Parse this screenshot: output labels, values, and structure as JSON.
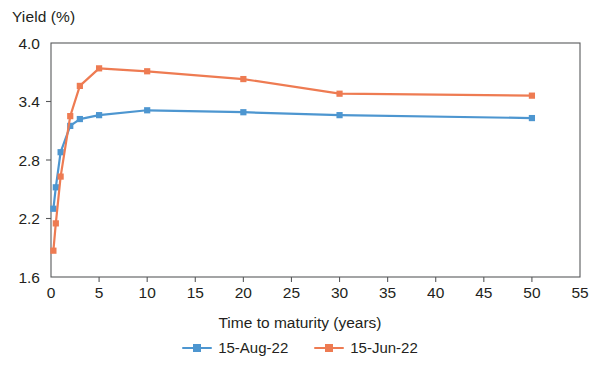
{
  "chart_data": {
    "type": "line",
    "title": "",
    "xlabel": "Time to maturity (years)",
    "ylabel": "Yield (%)",
    "xlim": [
      0,
      55
    ],
    "ylim": [
      1.6,
      4.0
    ],
    "xticks": [
      "0",
      "5",
      "10",
      "15",
      "20",
      "25",
      "30",
      "35",
      "40",
      "45",
      "50",
      "55"
    ],
    "yticks": [
      "1.6",
      "2.2",
      "2.8",
      "3.4",
      "4.0"
    ],
    "xtick_values": [
      0,
      5,
      10,
      15,
      20,
      25,
      30,
      35,
      40,
      45,
      50,
      55
    ],
    "ytick_values": [
      1.6,
      2.2,
      2.8,
      3.4,
      4.0
    ],
    "grid": false,
    "legend_position": "bottom",
    "x": [
      0.25,
      0.5,
      1,
      2,
      3,
      5,
      10,
      20,
      30,
      50
    ],
    "series": [
      {
        "name": "15-Aug-22",
        "color": "#4d96d0",
        "marker": "square",
        "values": [
          2.3,
          2.52,
          2.88,
          3.15,
          3.22,
          3.26,
          3.31,
          3.29,
          3.26,
          3.23
        ]
      },
      {
        "name": "15-Jun-22",
        "color": "#ee7b52",
        "marker": "square",
        "values": [
          1.87,
          2.15,
          2.63,
          3.25,
          3.56,
          3.74,
          3.71,
          3.63,
          3.48,
          3.46
        ]
      }
    ]
  },
  "axis": {
    "ylabel": "Yield (%)",
    "xlabel": "Time to maturity (years)"
  },
  "legend": {
    "items": [
      {
        "label": "15-Aug-22"
      },
      {
        "label": "15-Jun-22"
      }
    ]
  }
}
